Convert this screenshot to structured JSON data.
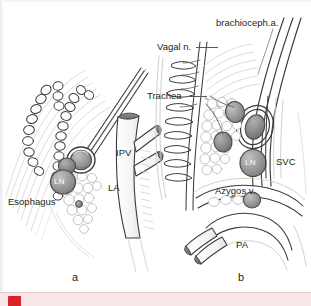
{
  "figure": {
    "type": "anatomical-illustration",
    "panels": [
      {
        "id": "a",
        "label": "a",
        "description": "Left atrium / esophagus region with lymph node",
        "labels": [
          {
            "name": "esophagus",
            "text": "Esophagus"
          },
          {
            "name": "lymph-node",
            "text": "LN"
          },
          {
            "name": "left-atrium",
            "text": "LA"
          },
          {
            "name": "inferior-pulmonary-vein",
            "text": "IPV"
          }
        ]
      },
      {
        "id": "b",
        "label": "b",
        "description": "Trachea / superior vena cava region with lymph node",
        "labels": [
          {
            "name": "brachiocephalic-artery",
            "text": "brachioceph.a."
          },
          {
            "name": "vagal-nerve",
            "text": "Vagal n."
          },
          {
            "name": "trachea",
            "text": "Trachea"
          },
          {
            "name": "superior-vena-cava",
            "text": "SVC"
          },
          {
            "name": "lymph-node",
            "text": "LN"
          },
          {
            "name": "azygos-vein",
            "text": "Azygos v."
          },
          {
            "name": "pulmonary-artery",
            "text": "PA"
          }
        ]
      }
    ]
  },
  "caption": {
    "text": "",
    "icon": "red-marker-icon"
  },
  "colors": {
    "line": "#3b3b3b",
    "line_light": "#c8c8c8",
    "node_fill": "#9a9a9a",
    "node_stroke": "#4a4a4a",
    "vessel_stump": "#7a7a7a",
    "text": "#231f20",
    "band": "#f8e6e8",
    "band_icon": "#d8232a",
    "background": "#ffffff"
  }
}
